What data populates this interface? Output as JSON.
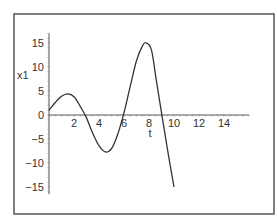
{
  "chart_data": {
    "type": "line",
    "title": "",
    "xlabel": "t",
    "ylabel": "x1",
    "xlim": [
      0,
      16
    ],
    "ylim": [
      -16,
      17
    ],
    "xticks": [
      2,
      4,
      6,
      8,
      10,
      12,
      14
    ],
    "yticks": [
      -15,
      -10,
      -5,
      0,
      5,
      10,
      15
    ],
    "xtick_labels": [
      "2",
      "4",
      "6",
      "8",
      "10",
      "12",
      "14"
    ],
    "ytick_labels": [
      "−15",
      "−10",
      "−5",
      "0",
      "5",
      "10",
      "15"
    ],
    "grid": false,
    "legend": null,
    "series": [
      {
        "name": "x1",
        "color": "#333333",
        "x": [
          0,
          0.5,
          1.0,
          1.5,
          2.0,
          2.5,
          3.0,
          3.5,
          4.0,
          4.5,
          5.0,
          5.5,
          6.0,
          6.5,
          7.0,
          7.5,
          7.8,
          8.2,
          8.6,
          9.0,
          9.5,
          10.0
        ],
        "y": [
          1.0,
          2.6,
          3.9,
          4.4,
          3.8,
          1.8,
          -0.6,
          -3.8,
          -6.4,
          -7.7,
          -7.0,
          -4.0,
          0.5,
          6.0,
          11.3,
          14.5,
          15.0,
          13.5,
          7.0,
          0.5,
          -7.5,
          -15.0
        ]
      }
    ]
  },
  "frame": {
    "border_color": "#555555"
  }
}
